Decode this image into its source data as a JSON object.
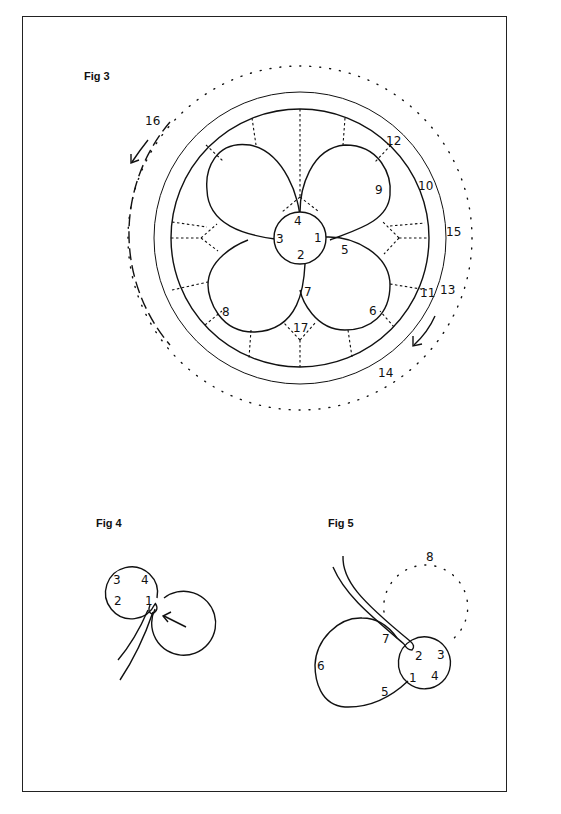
{
  "page": {
    "background": "#ffffff",
    "line_color": "#111111"
  },
  "fig3": {
    "label": "Fig 3",
    "numbers": {
      "n1": "1",
      "n2": "2",
      "n3": "3",
      "n4": "4",
      "n5": "5",
      "n6": "6",
      "n7": "7",
      "n8": "8",
      "n9": "9",
      "n10": "10",
      "n11": "11",
      "n12": "12",
      "n13": "13",
      "n14": "14",
      "n15": "15",
      "n16": "16",
      "n17": "17"
    }
  },
  "fig4": {
    "label": "Fig 4",
    "numbers": {
      "n1": "1",
      "n2": "2",
      "n3": "3",
      "n4": "4"
    }
  },
  "fig5": {
    "label": "Fig 5",
    "numbers": {
      "n1": "1",
      "n2": "2",
      "n3": "3",
      "n4": "4",
      "n5": "5",
      "n6": "6",
      "n7": "7",
      "n8": "8"
    }
  }
}
